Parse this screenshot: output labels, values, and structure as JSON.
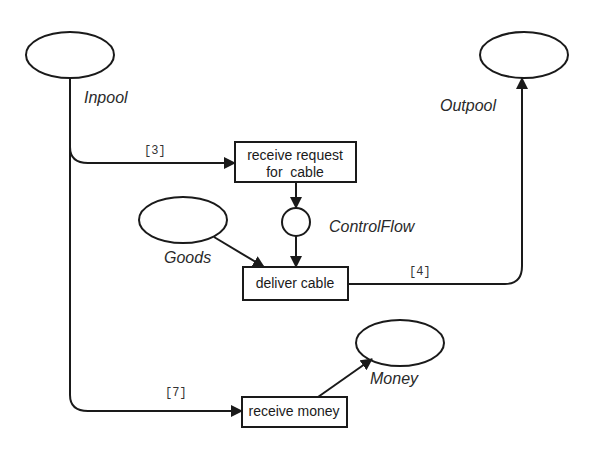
{
  "diagram": {
    "type": "petri-net",
    "places": [
      {
        "id": "inpool",
        "label": "Inpool"
      },
      {
        "id": "outpool",
        "label": "Outpool"
      },
      {
        "id": "goods",
        "label": "Goods"
      },
      {
        "id": "controlflow",
        "label": "ControlFlow"
      },
      {
        "id": "money",
        "label": "Money"
      }
    ],
    "transitions": [
      {
        "id": "receive_request",
        "line1": "receive request",
        "line2": "for  cable"
      },
      {
        "id": "deliver_cable",
        "label": "deliver cable"
      },
      {
        "id": "receive_money",
        "label": "receive money"
      }
    ],
    "arc_labels": {
      "inpool_to_request": "[3]",
      "deliver_to_outpool": "[4]",
      "inpool_to_money": "[7]"
    },
    "colors": {
      "stroke": "#1a1a1a",
      "background": "#ffffff"
    }
  }
}
